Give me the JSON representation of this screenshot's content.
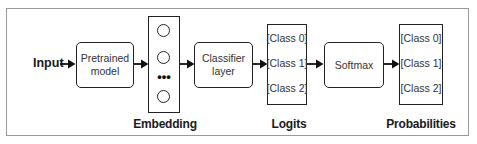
{
  "diagram": {
    "type": "flowchart",
    "direction": "left-to-right",
    "nodes": [
      {
        "id": "input",
        "label": "Input",
        "shape": "text"
      },
      {
        "id": "pretrained",
        "label_line1": "Pretrained",
        "label_line2": "model",
        "shape": "rounded-rect"
      },
      {
        "id": "embedding",
        "label": "Embedding",
        "shape": "vector",
        "elements": [
          "circle",
          "circle",
          "ellipsis",
          "circle"
        ],
        "ellipsis": "•••"
      },
      {
        "id": "classifier",
        "label_line1": "Classifier",
        "label_line2": "layer",
        "shape": "rounded-rect"
      },
      {
        "id": "logits",
        "label": "Logits",
        "shape": "vector",
        "entries": [
          "[Class 0]",
          "[Class 1]",
          "[Class 2]"
        ]
      },
      {
        "id": "softmax",
        "label": "Softmax",
        "shape": "rounded-rect"
      },
      {
        "id": "probabilities",
        "label": "Probabilities",
        "shape": "vector",
        "entries": [
          "[Class 0]",
          "[Class 1]",
          "[Class 2]"
        ]
      }
    ],
    "edges": [
      {
        "from": "input",
        "to": "pretrained"
      },
      {
        "from": "pretrained",
        "to": "embedding"
      },
      {
        "from": "embedding",
        "to": "classifier"
      },
      {
        "from": "classifier",
        "to": "logits"
      },
      {
        "from": "logits",
        "to": "softmax"
      },
      {
        "from": "softmax",
        "to": "probabilities"
      }
    ]
  },
  "colors": {
    "stroke": "#222222",
    "frame": "#9a9a9a",
    "text": "#1a1a1a",
    "background": "#ffffff"
  }
}
